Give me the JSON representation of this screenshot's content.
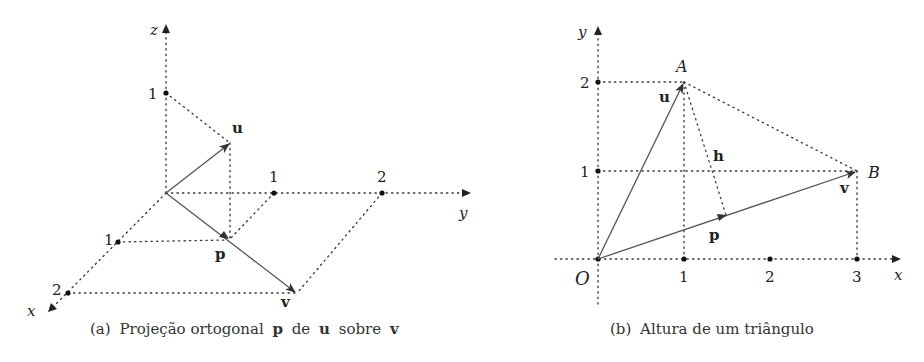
{
  "figure_a": {
    "caption_prefix": "(a)",
    "caption_text_1": "Projeção ortogonal",
    "caption_p": "p",
    "caption_text_2": "de",
    "caption_u": "u",
    "caption_text_3": "sobre",
    "caption_v": "v",
    "axes": {
      "x_label": "x",
      "y_label": "y",
      "z_label": "z"
    },
    "ticks": {
      "z1": "1",
      "y1": "1",
      "y2": "2",
      "x1": "1",
      "x2": "2"
    },
    "vectors": {
      "u": "u",
      "v": "v",
      "p": "p"
    }
  },
  "figure_b": {
    "caption_prefix": "(b)",
    "caption_text": "Altura de um triângulo",
    "axes": {
      "x_label": "x",
      "y_label": "y"
    },
    "ticks": {
      "x1": "1",
      "x2": "2",
      "x3": "3",
      "y1": "1",
      "y2": "2"
    },
    "points": {
      "origin": "O",
      "A": "A",
      "B": "B"
    },
    "vectors": {
      "u": "u",
      "v": "v",
      "p": "p",
      "h": "h"
    }
  },
  "colors": {
    "ink": "#222222",
    "vector": "#555555",
    "background": "#ffffff"
  }
}
